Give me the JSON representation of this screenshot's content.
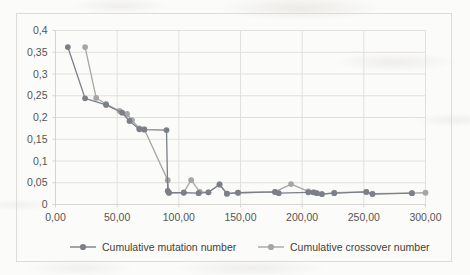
{
  "chart_data": {
    "type": "line",
    "title": "",
    "xlabel": "",
    "ylabel": "",
    "xlim": [
      0,
      300
    ],
    "ylim": [
      0,
      0.4
    ],
    "grid": true,
    "decimal_separator": ",",
    "xticks": [
      0,
      50,
      100,
      150,
      200,
      250,
      300
    ],
    "xticklabels": [
      "0,00",
      "50,00",
      "100,00",
      "150,00",
      "200,00",
      "250,00",
      "300,00"
    ],
    "yticks": [
      0,
      0.05,
      0.1,
      0.15,
      0.2,
      0.25,
      0.3,
      0.35,
      0.4
    ],
    "yticklabels": [
      "0",
      "0,05",
      "0,1",
      "0,15",
      "0,2",
      "0,25",
      "0,3",
      "0,35",
      "0,4"
    ],
    "legend_position": "bottom",
    "series": [
      {
        "name": "Cumulative mutation number",
        "color": "#7b7f87",
        "marker": "circle",
        "points": [
          [
            10,
            0.362
          ],
          [
            24,
            0.244
          ],
          [
            41,
            0.229
          ],
          [
            54,
            0.211
          ],
          [
            60,
            0.192
          ],
          [
            68,
            0.173
          ],
          [
            72,
            0.172
          ],
          [
            90,
            0.171
          ],
          [
            91,
            0.031
          ],
          [
            92,
            0.027
          ],
          [
            104,
            0.027
          ],
          [
            116,
            0.026
          ],
          [
            124,
            0.028
          ],
          [
            133,
            0.046
          ],
          [
            139,
            0.025
          ],
          [
            148,
            0.027
          ],
          [
            178,
            0.029
          ],
          [
            181,
            0.026
          ],
          [
            205,
            0.028
          ],
          [
            209,
            0.028
          ],
          [
            212,
            0.026
          ],
          [
            216,
            0.024
          ],
          [
            226,
            0.026
          ],
          [
            252,
            0.029
          ],
          [
            257,
            0.024
          ],
          [
            289,
            0.026
          ]
        ]
      },
      {
        "name": "Cumulative crossover number",
        "color": "#a6a7a5",
        "marker": "circle",
        "points": [
          [
            24,
            0.362
          ],
          [
            33,
            0.245
          ],
          [
            41,
            0.231
          ],
          [
            52,
            0.215
          ],
          [
            58,
            0.208
          ],
          [
            62,
            0.194
          ],
          [
            68,
            0.175
          ],
          [
            72,
            0.173
          ],
          [
            91,
            0.056
          ],
          [
            92,
            0.027
          ],
          [
            104,
            0.028
          ],
          [
            110,
            0.056
          ],
          [
            117,
            0.029
          ],
          [
            124,
            0.028
          ],
          [
            133,
            0.046
          ],
          [
            139,
            0.025
          ],
          [
            148,
            0.027
          ],
          [
            178,
            0.029
          ],
          [
            191,
            0.047
          ],
          [
            205,
            0.03
          ],
          [
            210,
            0.028
          ],
          [
            216,
            0.024
          ],
          [
            226,
            0.027
          ],
          [
            252,
            0.029
          ],
          [
            257,
            0.025
          ],
          [
            289,
            0.026
          ],
          [
            300,
            0.027
          ]
        ]
      }
    ]
  },
  "legend": {
    "items": [
      {
        "label": "Cumulative mutation number",
        "color": "#7b7f87"
      },
      {
        "label": "Cumulative crossover number",
        "color": "#a6a7a5"
      }
    ]
  },
  "colors": {
    "mutation": "#7b7f87",
    "crossover": "#a6a7a5",
    "grid": "#e2e0dc",
    "axis": "#d6d4d0",
    "tick_text": "#565551",
    "border": "#dedcd7",
    "background": "#fbfbf9"
  }
}
